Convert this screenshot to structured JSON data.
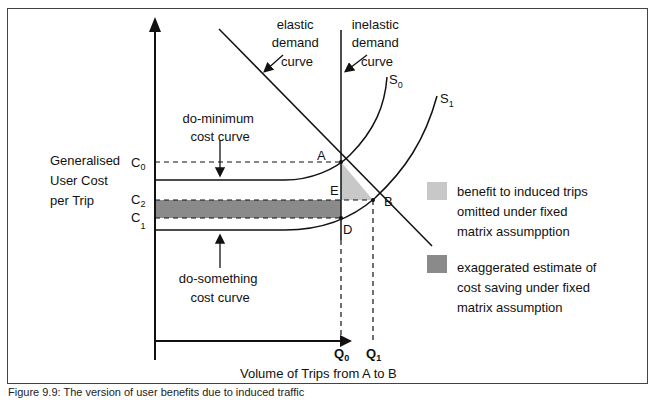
{
  "diagram": {
    "y_axis_label": [
      "Generalised",
      "User Cost",
      "per Trip"
    ],
    "x_axis_label": "Volume of Trips from A to B",
    "cost_ticks": {
      "c0": "C",
      "c0_sub": "0",
      "c2": "C",
      "c2_sub": "2",
      "c1": "C",
      "c1_sub": "1"
    },
    "volume_ticks": {
      "q0": "Q",
      "q0_sub": "0",
      "q1": "Q",
      "q1_sub": "1"
    },
    "points": {
      "a": "A",
      "b": "B",
      "d": "D",
      "e": "E"
    },
    "curves": {
      "s0": "S",
      "s0_sub": "0",
      "s1": "S",
      "s1_sub": "1",
      "elastic": [
        "elastic",
        "demand",
        "curve"
      ],
      "inelastic": [
        "inelastic",
        "demand",
        "curve"
      ],
      "do_minimum": [
        "do-minimum",
        "cost curve"
      ],
      "do_something": [
        "do-something",
        "cost curve"
      ]
    },
    "legend": [
      {
        "color": "#c8c8c8",
        "lines": [
          "benefit to induced trips",
          "omitted under fixed",
          "matrix assumpption"
        ]
      },
      {
        "color": "#8a8a8a",
        "lines": [
          "exaggerated estimate of",
          "cost saving under fixed",
          "matrix assumption"
        ]
      }
    ]
  },
  "caption": "Figure 9.9: The version of user benefits due to induced traffic"
}
